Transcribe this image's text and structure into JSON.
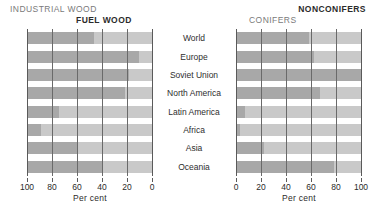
{
  "headers": {
    "industrial_wood": "INDUSTRIAL WOOD",
    "fuel_wood": "FUEL WOOD",
    "conifers": "CONIFERS",
    "nonconifers": "NONCONIFERS"
  },
  "axis_title": "Per cent",
  "colors": {
    "dark_segment": "#a8a8a8",
    "light_segment": "#c9c9c9",
    "gridline": "#6a6a6a",
    "text": "#2b2b2b",
    "header_light": "#7a7a7a",
    "background": "#ffffff"
  },
  "chart_data": {
    "type": "bar",
    "title": "",
    "subtitle": "",
    "orientation": "horizontal",
    "layout": "back-to-back stacked percentage bars, two panels sharing centered category labels",
    "categories": [
      "World",
      "Europe",
      "Soviet Union",
      "North America",
      "Latin America",
      "Africa",
      "Asia",
      "Oceania"
    ],
    "panels": [
      {
        "name": "left",
        "xlabel": "Per cent",
        "xlim": [
          100,
          0
        ],
        "reversed": true,
        "ticks": [
          100,
          80,
          60,
          40,
          20,
          0
        ],
        "tick_labels": [
          "100",
          "80",
          "60",
          "40",
          "20",
          "0"
        ],
        "grid": true,
        "legend_position": "top",
        "series": [
          {
            "name": "INDUSTRIAL WOOD",
            "color": "#a8a8a8",
            "values": [
              53,
              89,
              81,
              78,
              25,
              11,
              40,
              60
            ]
          },
          {
            "name": "FUEL WOOD",
            "color": "#c9c9c9",
            "values": [
              47,
              11,
              19,
              22,
              75,
              89,
              60,
              40
            ]
          }
        ]
      },
      {
        "name": "right",
        "xlabel": "Per cent",
        "xlim": [
          0,
          100
        ],
        "reversed": false,
        "ticks": [
          0,
          20,
          40,
          60,
          80,
          100
        ],
        "tick_labels": [
          "0",
          "20",
          "40",
          "60",
          "80",
          "100"
        ],
        "grid": true,
        "legend_position": "top",
        "series": [
          {
            "name": "CONIFERS",
            "color": "#a8a8a8",
            "values": [
              58,
              62,
              100,
              67,
              7,
              3,
              22,
              78
            ]
          },
          {
            "name": "NONCONIFERS",
            "color": "#c9c9c9",
            "values": [
              42,
              38,
              0,
              33,
              93,
              97,
              78,
              22
            ]
          }
        ]
      }
    ]
  }
}
